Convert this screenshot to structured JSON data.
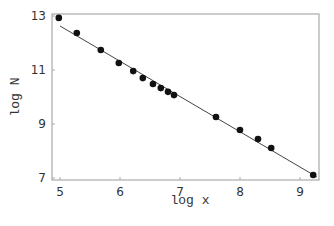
{
  "chart_data": {
    "type": "scatter",
    "title": "",
    "xlabel": "log x",
    "ylabel": "log N",
    "xlim": [
      4.97,
      9.32
    ],
    "ylim": [
      7.0,
      13.07
    ],
    "xticks": [
      5,
      6,
      7,
      8,
      9
    ],
    "yticks": [
      7,
      9,
      11,
      13
    ],
    "grid": false,
    "legend": null,
    "series": [
      {
        "name": "data",
        "type": "scatter",
        "marker": "filled-circle",
        "color": "#111111",
        "x": [
          4.98,
          5.28,
          5.68,
          5.98,
          6.22,
          6.38,
          6.55,
          6.68,
          6.8,
          6.9,
          7.6,
          8.0,
          8.3,
          8.52,
          9.22
        ],
        "y": [
          12.93,
          12.37,
          11.74,
          11.26,
          10.96,
          10.7,
          10.48,
          10.33,
          10.19,
          10.07,
          9.26,
          8.78,
          8.44,
          8.11,
          7.11
        ]
      },
      {
        "name": "fit",
        "type": "line",
        "color": "#444444",
        "x": [
          5.0,
          9.28
        ],
        "y": [
          12.63,
          7.04
        ]
      }
    ]
  },
  "style": {
    "frame_color": "#aaaaaa",
    "text_color": "#333333"
  }
}
